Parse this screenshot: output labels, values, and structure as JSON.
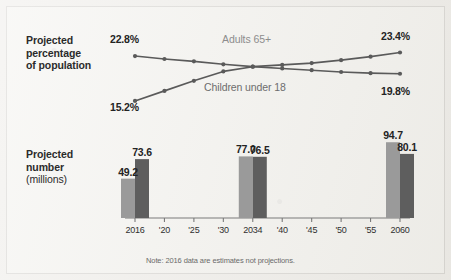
{
  "figure": {
    "background_color": "#f2f1ed",
    "note": "Note: 2016 data are estimates not projections."
  },
  "line_section": {
    "title_line1": "Projected",
    "title_line2": "percentage",
    "title_line3": "of population",
    "start_label_adults": "22.8%",
    "end_label_adults": "23.4%",
    "start_label_children": "15.2%",
    "end_label_children": "19.8%",
    "legend_adults": "Adults 65+",
    "legend_children": "Children under 18"
  },
  "bar_section": {
    "title_line1": "Projected",
    "title_line2": "number",
    "title_line3": "(millions)",
    "labels": {
      "g2016_light": "49.2",
      "g2016_dark": "73.6",
      "g2034_light": "77.0",
      "g2034_dark": "76.5",
      "g2060_light": "94.7",
      "g2060_dark": "80.1"
    }
  },
  "axis": {
    "ticks": [
      "2016",
      "'20",
      "'25",
      "'30",
      "2034",
      "'40",
      "'45",
      "'50",
      "'55",
      "2060"
    ]
  },
  "chart_data": [
    {
      "type": "line",
      "title": "Projected percentage of population",
      "xlabel": "",
      "ylabel": "Percent of population",
      "x": [
        "2016",
        "2020",
        "2025",
        "2030",
        "2034",
        "2040",
        "2045",
        "2050",
        "2055",
        "2060"
      ],
      "ylim": [
        14,
        24.5
      ],
      "grid": false,
      "legend_position": "inline-annotations",
      "series": [
        {
          "name": "Adults 65+",
          "color": "#5a5a5a",
          "values": [
            15.2,
            16.9,
            18.6,
            20.2,
            21.0,
            21.3,
            21.6,
            22.1,
            22.7,
            23.4
          ],
          "start_annotation": "15.2%",
          "end_annotation": "23.4%"
        },
        {
          "name": "Children under 18",
          "color": "#5a5a5a",
          "values": [
            22.8,
            22.3,
            21.9,
            21.4,
            21.0,
            20.7,
            20.4,
            20.1,
            19.9,
            19.8
          ],
          "start_annotation": "22.8%",
          "end_annotation": "19.8%"
        }
      ]
    },
    {
      "type": "bar",
      "title": "Projected number (millions)",
      "xlabel": "",
      "ylabel": "Millions",
      "categories": [
        "2016",
        "'20",
        "'25",
        "'30",
        "2034",
        "'40",
        "'45",
        "'50",
        "'55",
        "2060"
      ],
      "ylim": [
        0,
        100
      ],
      "grid": false,
      "note": "Note: 2016 data are estimates not projections.",
      "series": [
        {
          "name": "Adults 65+",
          "color": "#9a9a9a",
          "categories": [
            "2016",
            "2034",
            "2060"
          ],
          "values": [
            49.2,
            77.0,
            94.7
          ]
        },
        {
          "name": "Children under 18",
          "color": "#5e5e5e",
          "categories": [
            "2016",
            "2034",
            "2060"
          ],
          "values": [
            73.6,
            76.5,
            80.1
          ]
        }
      ]
    }
  ]
}
